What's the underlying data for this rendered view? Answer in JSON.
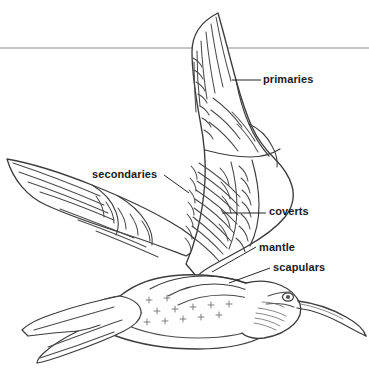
{
  "figure": {
    "background_color": "#ffffff",
    "ink_color": "#5a5a5a",
    "outline_color": "#3c3c3c",
    "text_color": "#1a1a1a",
    "rule_color": "#8c8c8c"
  },
  "rule": {
    "name": "top-horizontal-rule",
    "y": 48,
    "x_start": 0,
    "x_end": 369
  },
  "labels": [
    {
      "id": "primaries",
      "text": "primaries",
      "leader": {
        "x1": 232,
        "y1": 80,
        "x2": 261,
        "y2": 80
      }
    },
    {
      "id": "secondaries",
      "text": "secondaries",
      "leader": {
        "x1": 164,
        "y1": 175,
        "x2": 189,
        "y2": 193
      }
    },
    {
      "id": "coverts",
      "text": "coverts",
      "leader": {
        "x1": 222,
        "y1": 213,
        "x2": 266,
        "y2": 213
      }
    },
    {
      "id": "mantle",
      "text": "mantle",
      "leader": {
        "x1": 212,
        "y1": 272,
        "x2": 256,
        "y2": 247
      }
    },
    {
      "id": "scapulars",
      "text": "scapulars",
      "leader": {
        "x1": 229,
        "y1": 283,
        "x2": 270,
        "y2": 268
      }
    }
  ]
}
